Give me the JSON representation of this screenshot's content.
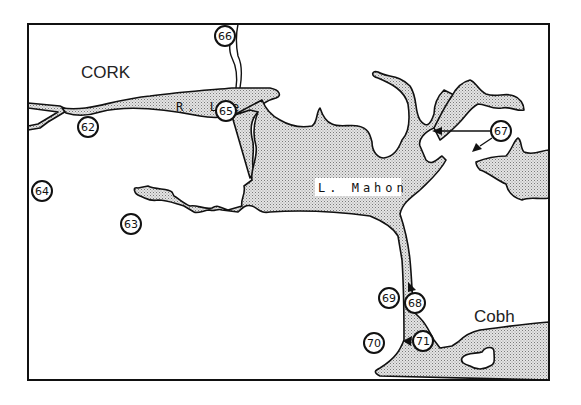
{
  "map": {
    "place_labels": {
      "cork": "CORK",
      "cobh": "Cobh"
    },
    "water_labels": {
      "river_lee": "R. Lee",
      "lough_mahon": "L. Mahon"
    },
    "sites": [
      {
        "id": "62",
        "label": "62"
      },
      {
        "id": "63",
        "label": "63"
      },
      {
        "id": "64",
        "label": "64"
      },
      {
        "id": "65",
        "label": "65"
      },
      {
        "id": "66",
        "label": "66"
      },
      {
        "id": "67",
        "label": "67"
      },
      {
        "id": "68",
        "label": "68"
      },
      {
        "id": "69",
        "label": "69"
      },
      {
        "id": "70",
        "label": "70"
      },
      {
        "id": "71",
        "label": "71"
      }
    ],
    "colors": {
      "ink": "#111111",
      "paper": "#ffffff",
      "water_stipple": "#9a9a9a"
    }
  }
}
